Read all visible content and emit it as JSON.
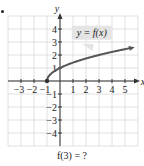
{
  "chart_data": {
    "type": "line",
    "title": "",
    "xlabel": "x",
    "ylabel": "y",
    "xlim": [
      -4,
      6
    ],
    "ylim": [
      -5,
      5
    ],
    "grid": true,
    "x_ticks": [
      -3,
      -2,
      -1,
      1,
      2,
      3,
      4,
      5
    ],
    "y_ticks": [
      -4,
      -3,
      -2,
      -1,
      1,
      2,
      3,
      4
    ],
    "x_tick_labels": [
      "−3",
      "−2",
      "−1",
      "1",
      "2",
      "3",
      "4",
      "5"
    ],
    "y_tick_labels": [
      "−4",
      "−3",
      "−2",
      "−1",
      "1",
      "2",
      "3",
      "4"
    ],
    "series": [
      {
        "name": "y = f(x)",
        "x": [
          -1,
          -0.75,
          -0.5,
          0,
          0.5,
          1,
          2,
          3,
          4,
          5,
          5.6
        ],
        "y": [
          0,
          0.5,
          0.71,
          1,
          1.22,
          1.41,
          1.73,
          2,
          2.24,
          2.45,
          2.57
        ],
        "start_point": {
          "x": -1,
          "y": 0,
          "filled": true
        },
        "end_arrow": true
      }
    ],
    "annotations": [
      {
        "text": "y = f(x)",
        "type": "callout",
        "x": 2.3,
        "y": 3.6
      }
    ]
  },
  "labels": {
    "axis_x": "x",
    "axis_y": "y",
    "callout": "y = f(x)",
    "question": "f(3) = ?"
  },
  "colors": {
    "curve": "#555555",
    "grid": "#d8d8d8",
    "axis": "#333333",
    "callout_bg": "#e4e4e4"
  }
}
